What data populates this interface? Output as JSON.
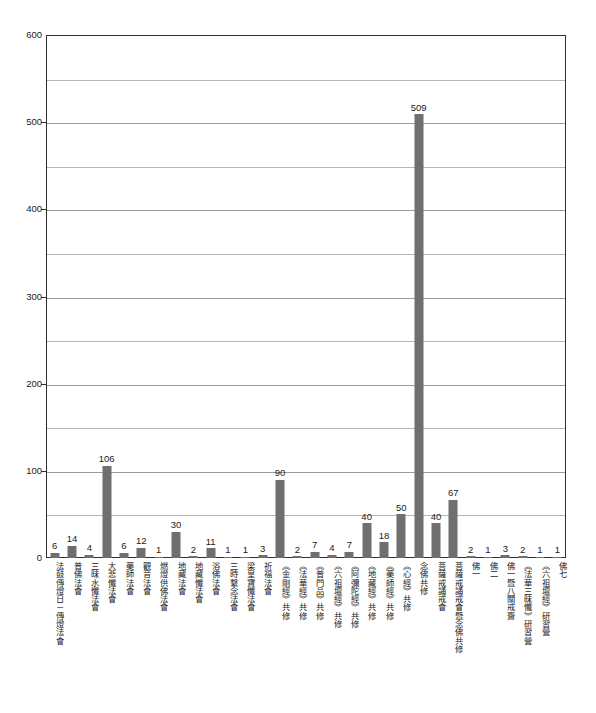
{
  "chart_data": {
    "type": "bar",
    "title": "",
    "subtitle": "",
    "xlabel": "",
    "ylabel": "",
    "ylim": [
      0,
      600
    ],
    "y_ticks": [
      0,
      100,
      200,
      300,
      400,
      500,
      600
    ],
    "y_tick_labels": [
      "0",
      "100",
      "200",
      "300",
      "400",
      "500",
      "600"
    ],
    "gridlines": [
      0,
      50,
      100,
      150,
      200,
      250,
      300,
      350,
      400,
      450,
      500,
      550,
      600
    ],
    "grid": true,
    "legend": null,
    "bar_color": "#6f6f6f",
    "axis_color": "#2f2f2f",
    "grid_color": "#b5b5b5",
    "categories": [
      "法鼓傳燈日－傳燈法會",
      "普佛法會",
      "三昧水懺法會",
      "大悲懺法會",
      "藥師法會",
      "觀音法會",
      "燃燈供佛法會",
      "地藏法會",
      "地藏懺法會",
      "浴佛法會",
      "三時繫念法會",
      "梁皇寶懺法會",
      "祈福法會",
      "《金剛經》共修",
      "《法華經》共修",
      "《普門品》共修",
      "《六祖壇經》共修",
      "《阿彌陀經》共修",
      "《地藏經》共修",
      "《藥師經》共修",
      "《心經》共修",
      "念佛共修",
      "菩薩戒誦戒會",
      "菩薩戒誦戒會暨念佛共修",
      "佛一",
      "佛二",
      "佛一暨八關戒齋",
      "《法華三昧懺》研習營",
      "《六祖壇經》研習營",
      "佛七"
    ],
    "values": [
      6,
      14,
      4,
      106,
      6,
      12,
      1,
      30,
      2,
      11,
      1,
      1,
      3,
      90,
      2,
      7,
      4,
      7,
      40,
      18,
      50,
      509,
      40,
      67,
      2,
      1,
      3,
      2,
      1,
      1
    ],
    "value_labels": [
      "6",
      "14",
      "4",
      "106",
      "6",
      "12",
      "1",
      "30",
      "2",
      "11",
      "1",
      "1",
      "3",
      "90",
      "2",
      "7",
      "4",
      "7",
      "40",
      "18",
      "50",
      "509",
      "40",
      "67",
      "2",
      "1",
      "3",
      "2",
      "1",
      "1"
    ]
  }
}
